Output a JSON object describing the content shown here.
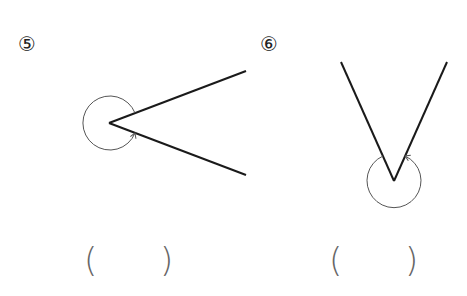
{
  "problems": [
    {
      "number": "⑤",
      "answer_open": "(",
      "answer_close": ")",
      "answer_value": ""
    },
    {
      "number": "⑥",
      "answer_open": "(",
      "answer_close": ")",
      "answer_value": ""
    }
  ],
  "colors": {
    "line": "#1a1a1a",
    "arc": "#555555",
    "paren": "#666666"
  }
}
